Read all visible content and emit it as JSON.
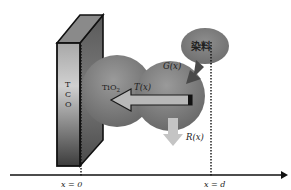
{
  "diagram": {
    "type": "schematic",
    "tco_label": [
      "T",
      "C",
      "O"
    ],
    "tio2_label": "TiO",
    "tio2_subscript": "2",
    "dye_label": "染料",
    "generation_label": "G(x)",
    "transport_label": "T(x)",
    "recombination_label": "R(x)",
    "axis": {
      "start_label": "x = 0",
      "end_label": "x = d"
    },
    "colors": {
      "tco_front_light": "#c8c8c8",
      "tco_front_dark": "#3a3a3a",
      "tco_side": "#6a6a6a",
      "tco_top": "#8c8c8c",
      "particle": "#8a8a8a",
      "particle_dark": "#5a5a5a",
      "dye": "#7a7a7a",
      "generation_arrow": "#4a4a4a",
      "transport_arrow": "#b5b5b5",
      "recombination_arrow": "#c4c4c4",
      "axis": "#111111"
    }
  }
}
